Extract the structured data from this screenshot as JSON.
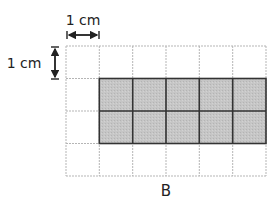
{
  "diagram": {
    "unit_label_horizontal": "1 cm",
    "unit_label_vertical": "1 cm",
    "caption": "B",
    "grid": {
      "columns": 6,
      "rows": 4,
      "cell_unit": "1 cm",
      "grid_line_color": "#b5b5b5",
      "shaded_fill": "#c4c4c4",
      "shaded_border": "#333333",
      "shaded_region": {
        "col_start": 1,
        "col_end": 6,
        "row_start": 1,
        "row_end": 3
      },
      "shaded_cell_count": 10
    }
  }
}
